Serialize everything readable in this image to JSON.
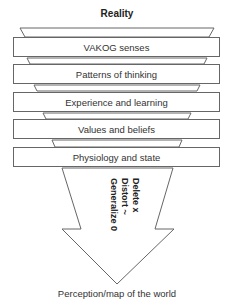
{
  "title": "Reality",
  "filters": [
    {
      "label": "VAKOG senses"
    },
    {
      "label": "Patterns of thinking"
    },
    {
      "label": "Experience and learning"
    },
    {
      "label": "Values and beliefs"
    },
    {
      "label": "Physiology and state"
    }
  ],
  "arrow": {
    "lines": [
      "Delete x",
      "Distort ~",
      "Generalize 0"
    ]
  },
  "output_label": "Perception/map of the world",
  "colors": {
    "stroke": "#666666",
    "fill": "#ffffff",
    "text": "#222222"
  }
}
